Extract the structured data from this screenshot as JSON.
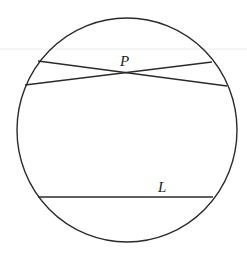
{
  "diagram": {
    "type": "geometry",
    "colors": {
      "stroke": "#2b2b2b",
      "background": "#ffffff",
      "artifact": "#e6e6e6"
    },
    "circle": {
      "cx": 127,
      "cy": 130,
      "rx": 110,
      "ry": 112
    },
    "chords": [
      {
        "name": "chord-1",
        "x1": 38,
        "y1": 61,
        "x2": 227,
        "y2": 86
      },
      {
        "name": "chord-2",
        "x1": 25,
        "y1": 85,
        "x2": 212,
        "y2": 62
      },
      {
        "name": "chord-L",
        "x1": 38,
        "y1": 197,
        "x2": 213,
        "y2": 197
      }
    ],
    "points": [
      {
        "label": "P",
        "x": 125,
        "y": 72,
        "label_x": 120,
        "label_y": 66
      }
    ],
    "labels": {
      "point_p": "P",
      "line_l": "L"
    },
    "label_positions": {
      "line_l": {
        "x": 158,
        "y": 192
      }
    }
  }
}
